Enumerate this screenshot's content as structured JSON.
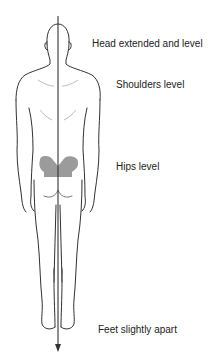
{
  "diagram": {
    "type": "posture-assessment-figure",
    "view": "posterior standing view",
    "plumb_line": {
      "direction": "downward",
      "color": "#333333"
    },
    "highlight": {
      "region": "pelvis",
      "color": "#8a8a8a"
    },
    "labels": [
      {
        "id": "head",
        "text": "Head extended and level"
      },
      {
        "id": "shoulders",
        "text": "Shoulders level"
      },
      {
        "id": "hips",
        "text": "Hips level"
      },
      {
        "id": "feet",
        "text": "Feet slightly apart"
      }
    ]
  }
}
